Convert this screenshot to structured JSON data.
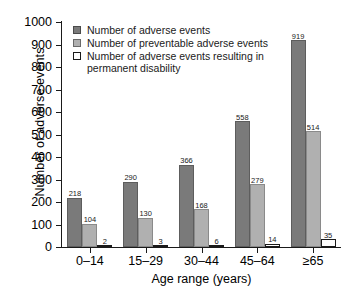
{
  "chart_data": {
    "type": "bar",
    "title": "",
    "xlabel": "Age range (years)",
    "ylabel": "Number of adverse events",
    "ylim": [
      0,
      1000
    ],
    "ytick_step": 100,
    "yticks": [
      "1000",
      "900",
      "800",
      "700",
      "600",
      "500",
      "400",
      "300",
      "200",
      "100",
      "0"
    ],
    "grid": false,
    "legend_position": "top-left inside plot",
    "categories": [
      "0–14",
      "15–29",
      "30–44",
      "45–64",
      "≥65"
    ],
    "series": [
      {
        "name": "Number of adverse events",
        "color": "#7a7a7a",
        "values": [
          218,
          290,
          366,
          558,
          919
        ]
      },
      {
        "name": "Number of preventable adverse events",
        "color": "#b0b0b0",
        "values": [
          104,
          130,
          168,
          279,
          514
        ]
      },
      {
        "name": "Number of adverse events resulting in permanent disability",
        "color": "#ffffff",
        "values": [
          2,
          3,
          6,
          14,
          35
        ]
      }
    ]
  },
  "legend": {
    "entries": [
      {
        "label": "Number of adverse events"
      },
      {
        "label": "Number of preventable adverse events"
      },
      {
        "label": "Number of adverse events resulting in"
      },
      {
        "label": "permanent disability"
      }
    ]
  }
}
